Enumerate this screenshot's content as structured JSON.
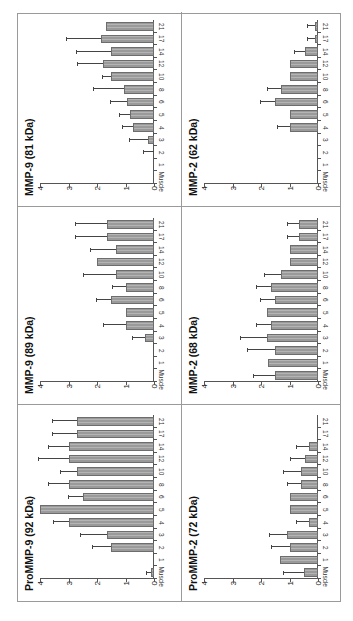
{
  "figure": {
    "orientation": "rotated -90deg (text reads bottom-to-top)",
    "categories": [
      "Muscle",
      "1",
      "2",
      "3",
      "4",
      "5",
      "6",
      "8",
      "10",
      "12",
      "14",
      "17",
      "21"
    ],
    "y_ticks": [
      "0",
      "1",
      "2",
      "3",
      "4"
    ],
    "colors": {
      "bar_fill": "#9a9a9a",
      "bar_border": "#6d6d6d",
      "axis": "#555555",
      "frame": "#9a9a9a",
      "title": "#111111"
    }
  },
  "chart_data": [
    {
      "type": "bar",
      "title": "ProMMP-9 (92 kDa)",
      "categories": [
        "Muscle",
        "1",
        "2",
        "3",
        "4",
        "5",
        "6",
        "8",
        "10",
        "12",
        "14",
        "17",
        "21"
      ],
      "values": [
        0.1,
        0,
        1.5,
        1.65,
        3.0,
        4.0,
        2.5,
        3.0,
        2.7,
        3.0,
        3.0,
        2.7,
        2.7
      ],
      "errors": [
        0.15,
        0,
        0.65,
        0.9,
        0.5,
        0,
        0.5,
        0.7,
        0.55,
        1.05,
        0.7,
        0.85,
        0.85
      ],
      "xlabel": "",
      "ylabel": "",
      "ylim": [
        0,
        4
      ],
      "grid": false
    },
    {
      "type": "bar",
      "title": "MMP-9 (89 kDa)",
      "categories": [
        "Muscle",
        "1",
        "2",
        "3",
        "4",
        "5",
        "6",
        "8",
        "10",
        "12",
        "14",
        "17",
        "21"
      ],
      "values": [
        0,
        0,
        0,
        0.3,
        1.0,
        1.0,
        1.5,
        1.0,
        1.35,
        2.0,
        1.35,
        1.65,
        1.65
      ],
      "errors": [
        0,
        0,
        0,
        0.45,
        0.75,
        0,
        0.5,
        0.45,
        1.1,
        0,
        0.85,
        1.1,
        1.1
      ],
      "xlabel": "",
      "ylabel": "",
      "ylim": [
        0,
        4
      ],
      "grid": false
    },
    {
      "type": "bar",
      "title": "MMP-9 (81 kDa)",
      "categories": [
        "Muscle",
        "1",
        "2",
        "3",
        "4",
        "5",
        "6",
        "8",
        "10",
        "12",
        "14",
        "17",
        "21"
      ],
      "values": [
        0,
        0,
        0,
        0.2,
        0.75,
        0.85,
        0.95,
        1.05,
        1.5,
        1.8,
        1.5,
        1.85,
        1.7
      ],
      "errors": [
        0,
        0,
        0.35,
        0.65,
        0.35,
        0.35,
        0.55,
        1.05,
        0.3,
        0.85,
        1.2,
        1.2,
        0
      ],
      "xlabel": "",
      "ylabel": "",
      "ylim": [
        0,
        4
      ],
      "grid": false
    },
    {
      "type": "bar",
      "title": "ProMMP-2 (72 kDa)",
      "categories": [
        "Muscle",
        "1",
        "2",
        "3",
        "4",
        "5",
        "6",
        "8",
        "10",
        "12",
        "14",
        "17",
        "21"
      ],
      "values": [
        0.5,
        1.35,
        1.0,
        1.1,
        0.3,
        1.0,
        1.0,
        0.6,
        0.6,
        0.45,
        0.3,
        0,
        0
      ],
      "errors": [
        0.7,
        0,
        0.6,
        0.6,
        0.45,
        0,
        0,
        0.45,
        0.6,
        0.5,
        0.45,
        0,
        0
      ],
      "xlabel": "",
      "ylabel": "",
      "ylim": [
        0,
        4
      ],
      "grid": false
    },
    {
      "type": "bar",
      "title": "MMP-2 (68 kDa)",
      "categories": [
        "Muscle",
        "1",
        "2",
        "3",
        "4",
        "5",
        "6",
        "8",
        "10",
        "12",
        "14",
        "17",
        "21"
      ],
      "values": [
        1.5,
        1.75,
        1.5,
        1.8,
        1.65,
        1.8,
        1.5,
        1.65,
        1.3,
        1.0,
        1.0,
        0.65,
        0.65
      ],
      "errors": [
        0.75,
        0,
        0.95,
        0.9,
        0.5,
        0,
        0.5,
        0.5,
        0.55,
        0,
        0,
        0.4,
        0.4
      ],
      "xlabel": "",
      "ylabel": "",
      "ylim": [
        0,
        4
      ],
      "grid": false
    },
    {
      "type": "bar",
      "title": "MMP-2 (62 kDa)",
      "categories": [
        "Muscle",
        "1",
        "2",
        "3",
        "4",
        "5",
        "6",
        "8",
        "10",
        "12",
        "14",
        "17",
        "21"
      ],
      "values": [
        0,
        0,
        0,
        0,
        1.0,
        1.0,
        1.5,
        1.3,
        1.0,
        1.0,
        0.45,
        0.1,
        0.1
      ],
      "errors": [
        0,
        0,
        0,
        0,
        0.4,
        0,
        0.5,
        0.45,
        0,
        0,
        0.35,
        0.25,
        0.25
      ],
      "xlabel": "",
      "ylabel": "",
      "ylim": [
        0,
        4
      ],
      "grid": false
    }
  ]
}
